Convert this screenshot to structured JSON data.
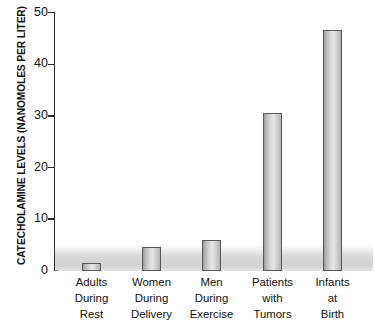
{
  "chart_data": {
    "type": "bar",
    "title": "",
    "xlabel": "",
    "ylabel": "CATECHOLAMINE LEVELS (NANOMOLES PER LITER)",
    "ylim": [
      0,
      50
    ],
    "yticks": [
      0,
      10,
      20,
      30,
      40,
      50
    ],
    "ytick_labels": [
      "0",
      "10",
      "20",
      "30",
      "40",
      "50"
    ],
    "grid": false,
    "legend": null,
    "categories": [
      "Adults During Rest",
      "Women During Delivery",
      "Men During Exercise",
      "Patients with Tumors",
      "Infants at Birth"
    ],
    "category_lines": [
      [
        "Adults",
        "During",
        "Rest"
      ],
      [
        "Women",
        "During",
        "Delivery"
      ],
      [
        "Men",
        "During",
        "Exercise"
      ],
      [
        "Patients",
        "with",
        "Tumors"
      ],
      [
        "Infants",
        "at",
        "Birth"
      ]
    ],
    "values": [
      1.5,
      4.7,
      6.0,
      30.6,
      46.6
    ],
    "annotations": [
      {
        "name": "normal-range-band",
        "description": "shaded gray band spanning chart width from 0 to about 5 nanomoles per liter",
        "range": [
          0,
          5
        ]
      }
    ],
    "colors": {
      "bar_border": "#5a5a5a",
      "bar_fill_light": "#e6e6e6",
      "bar_fill_dark": "#9a9a9a",
      "axis": "#2b2b2b",
      "text": "#111111",
      "band": "#c9c9c9",
      "background": "#ffffff"
    }
  }
}
